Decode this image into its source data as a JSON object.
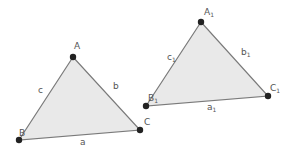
{
  "diagram": {
    "colors": {
      "fill": "#e9e9e9",
      "edge": "#7a7a7a",
      "vertex": "#222222",
      "label": "#555555"
    },
    "triangles": [
      {
        "id": "ABC",
        "vertices": [
          {
            "name": "A",
            "base": "A",
            "sub": "",
            "x": 73,
            "y": 57,
            "lx": 74,
            "ly": 42
          },
          {
            "name": "B",
            "base": "B",
            "sub": "",
            "x": 19,
            "y": 140,
            "lx": 19,
            "ly": 129
          },
          {
            "name": "C",
            "base": "C",
            "sub": "",
            "x": 140,
            "y": 130,
            "lx": 144,
            "ly": 118
          }
        ],
        "sides": [
          {
            "name": "c",
            "base": "c",
            "sub": "",
            "lx": 38,
            "ly": 86
          },
          {
            "name": "b",
            "base": "b",
            "sub": "",
            "lx": 113,
            "ly": 82
          },
          {
            "name": "a",
            "base": "a",
            "sub": "",
            "lx": 80,
            "ly": 138
          }
        ]
      },
      {
        "id": "A1B1C1",
        "vertices": [
          {
            "name": "A1",
            "base": "A",
            "sub": "1",
            "x": 201,
            "y": 22,
            "lx": 204,
            "ly": 8
          },
          {
            "name": "B1",
            "base": "B",
            "sub": "1",
            "x": 146,
            "y": 106,
            "lx": 148,
            "ly": 94
          },
          {
            "name": "C1",
            "base": "C",
            "sub": "1",
            "x": 268,
            "y": 96,
            "lx": 270,
            "ly": 84
          }
        ],
        "sides": [
          {
            "name": "c1",
            "base": "c",
            "sub": "1",
            "lx": 167,
            "ly": 53
          },
          {
            "name": "b1",
            "base": "b",
            "sub": "1",
            "lx": 241,
            "ly": 48
          },
          {
            "name": "a1",
            "base": "a",
            "sub": "1",
            "lx": 207,
            "ly": 103
          }
        ]
      }
    ]
  }
}
